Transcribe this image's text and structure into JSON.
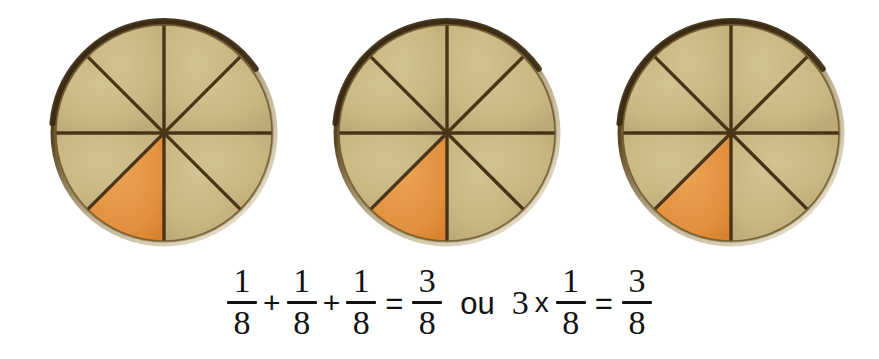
{
  "page": {
    "background_color": "#ffffff",
    "width": 879,
    "height": 359
  },
  "colors": {
    "plate_fill": "#c9b883",
    "plate_fill_light": "#d2c392",
    "plate_fill_shadow": "#bcab78",
    "shaded_fill": "#e2913e",
    "shaded_fill_light": "#eba355",
    "divider_line": "#4a3418",
    "rim_dark": "#3b2a12",
    "rim_light": "#e7e0cd",
    "text": "#121212"
  },
  "diagram": {
    "label": "three-circle-fraction-model",
    "total_parts": 8,
    "shaded_parts_per_circle": 1,
    "total_shaded_parts": 3,
    "fraction_shaded": "3/8",
    "circles": [
      {
        "name": "circle-1",
        "center_x": 160,
        "center_y": 129,
        "radius": 108,
        "sectors": 8,
        "shaded_sector_index": 4,
        "shaded_label": "1/8"
      },
      {
        "name": "circle-2",
        "center_x": 443,
        "center_y": 129,
        "radius": 108,
        "sectors": 8,
        "shaded_sector_index": 4,
        "shaded_label": "1/8"
      },
      {
        "name": "circle-3",
        "center_x": 727,
        "center_y": 129,
        "radius": 108,
        "sectors": 8,
        "shaded_sector_index": 4,
        "shaded_label": "1/8"
      }
    ]
  },
  "equation": {
    "full_text": "1/8 + 1/8 + 1/8 = 3/8  ou  3 x 1/8 = 3/8",
    "left": {
      "terms": [
        {
          "numerator": "1",
          "denominator": "8"
        },
        {
          "numerator": "1",
          "denominator": "8"
        },
        {
          "numerator": "1",
          "denominator": "8"
        }
      ],
      "plus": "+",
      "equals": "=",
      "result": {
        "numerator": "3",
        "denominator": "8"
      }
    },
    "connector": "ou",
    "right": {
      "multiplier": "3",
      "times": "x",
      "factor": {
        "numerator": "1",
        "denominator": "8"
      },
      "equals": "=",
      "result": {
        "numerator": "3",
        "denominator": "8"
      }
    }
  },
  "chart_data": {
    "type": "pie",
    "title": "",
    "subtitle": "",
    "xlabel": "",
    "ylabel": "",
    "legend_position": "none",
    "grid": false,
    "charts": [
      {
        "name": "circle-1",
        "categories": [
          "shaded",
          "unshaded"
        ],
        "values": [
          1,
          7
        ],
        "slice_fraction": [
          0.125,
          0.875
        ],
        "colors": [
          "#e2913e",
          "#c9b883"
        ]
      },
      {
        "name": "circle-2",
        "categories": [
          "shaded",
          "unshaded"
        ],
        "values": [
          1,
          7
        ],
        "slice_fraction": [
          0.125,
          0.875
        ],
        "colors": [
          "#e2913e",
          "#c9b883"
        ]
      },
      {
        "name": "circle-3",
        "categories": [
          "shaded",
          "unshaded"
        ],
        "values": [
          1,
          7
        ],
        "slice_fraction": [
          0.125,
          0.875
        ],
        "colors": [
          "#e2913e",
          "#c9b883"
        ]
      }
    ],
    "annotations": [
      "1/8 + 1/8 + 1/8 = 3/8",
      "ou",
      "3 x 1/8 = 3/8"
    ]
  }
}
